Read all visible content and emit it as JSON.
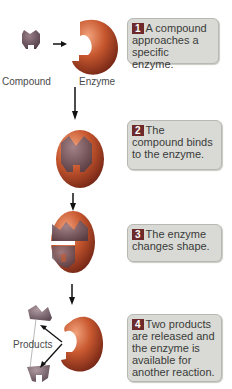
{
  "steps": [
    {
      "num": "1",
      "text": "A compound approaches a specific enzyme."
    },
    {
      "num": "2",
      "text": "The compound binds to the enzyme."
    },
    {
      "num": "3",
      "text": "The enzyme changes shape."
    },
    {
      "num": "4",
      "text": "Two products are released and the enzyme is available for another reaction."
    }
  ],
  "labels": {
    "compound": "Compound",
    "enzyme": "Enzyme",
    "products": "Products"
  },
  "colors": {
    "enzyme": "#c4623e",
    "compound": "#7a5a66",
    "box": "#d9dad5",
    "badge": "#6e2a2a"
  }
}
